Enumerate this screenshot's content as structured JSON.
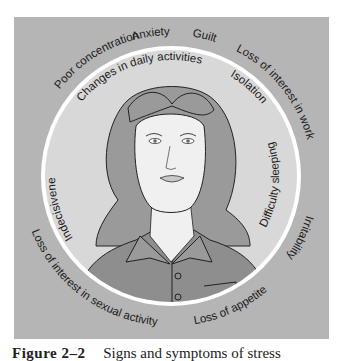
{
  "figure": {
    "number": "Figure 2–2",
    "caption": "Signs and symptoms of stress",
    "colors": {
      "background_panel": "#b5b5b5",
      "inner_circle": "#d8d8d8",
      "ring": "#ffffff",
      "hair": "#9a9a9a",
      "shirt": "#8e8e8e",
      "skin": "#f0f0f0",
      "line": "#222222"
    },
    "outer_labels": [
      "Poor concentration",
      "Anxiety",
      "Guilt",
      "Loss of interest in work",
      "Irritability",
      "Loss of appetite",
      "Loss of interest in sexual activity"
    ],
    "inner_labels": [
      "Changes in daily activities",
      "Isolation",
      "Difficulty sleeping",
      "Indecisiveness"
    ],
    "illustration": "Woman with worried expression"
  }
}
